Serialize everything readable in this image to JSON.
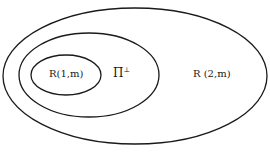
{
  "diagram": {
    "type": "nested-set-diagram",
    "sets": [
      {
        "id": "outer",
        "label": "R (2,m)"
      },
      {
        "id": "middle",
        "label": "Π",
        "superscript": "⊥"
      },
      {
        "id": "inner",
        "label": "R(1,m)"
      }
    ],
    "colors": {
      "stroke": "#1a1a1a",
      "background": "#ffffff"
    }
  }
}
